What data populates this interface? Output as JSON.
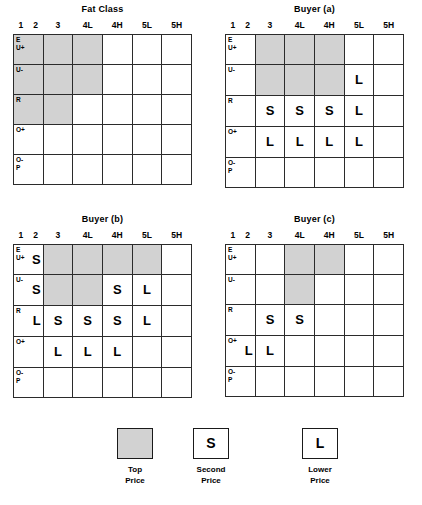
{
  "chart_data": {
    "type": "heatmap",
    "xlabel": "Fat Class",
    "ylabel": "Conformation Class",
    "columns": [
      "1",
      "2",
      "3",
      "4L",
      "4H",
      "5L",
      "5H"
    ],
    "column_groups": [
      "1-2",
      "3",
      "4L",
      "4H",
      "5L",
      "5H"
    ],
    "rows": [
      {
        "line1": "E",
        "line2": "U+"
      },
      {
        "line1": "U-",
        "line2": ""
      },
      {
        "line1": "R",
        "line2": ""
      },
      {
        "line1": "O+",
        "line2": ""
      },
      {
        "line1": "O-",
        "line2": "P"
      }
    ],
    "legend_position": "bottom",
    "grid": true,
    "panels": [
      {
        "name": "fat-class",
        "title": "Fat Class",
        "cells": [
          [
            "top",
            "top",
            "top",
            "",
            "",
            ""
          ],
          [
            "top",
            "top",
            "top",
            "",
            "",
            ""
          ],
          [
            "top",
            "top",
            "",
            "",
            "",
            ""
          ],
          [
            "",
            "",
            "",
            "",
            "",
            ""
          ],
          [
            "",
            "",
            "",
            "",
            "",
            ""
          ]
        ],
        "marks": [
          [
            "",
            "",
            "",
            "",
            "",
            ""
          ],
          [
            "",
            "",
            "",
            "",
            "",
            ""
          ],
          [
            "",
            "",
            "",
            "",
            "",
            ""
          ],
          [
            "",
            "",
            "",
            "",
            "",
            ""
          ],
          [
            "",
            "",
            "",
            "",
            "",
            ""
          ]
        ]
      },
      {
        "name": "buyer-a",
        "title": "Buyer (a)",
        "cells": [
          [
            "",
            "top",
            "top",
            "top",
            "",
            ""
          ],
          [
            "",
            "top",
            "top",
            "top",
            "",
            ""
          ],
          [
            "",
            "",
            "",
            "",
            "",
            ""
          ],
          [
            "",
            "",
            "",
            "",
            "",
            ""
          ],
          [
            "",
            "",
            "",
            "",
            "",
            ""
          ]
        ],
        "marks": [
          [
            "",
            "",
            "",
            "",
            "",
            ""
          ],
          [
            "",
            "",
            "",
            "",
            "L",
            ""
          ],
          [
            "",
            "S",
            "S",
            "S",
            "L",
            ""
          ],
          [
            "",
            "L",
            "L",
            "L",
            "L",
            ""
          ],
          [
            "",
            "",
            "",
            "",
            "",
            ""
          ]
        ]
      },
      {
        "name": "buyer-b",
        "title": "Buyer (b)",
        "cells": [
          [
            "",
            "top",
            "top",
            "top",
            "top",
            ""
          ],
          [
            "",
            "top",
            "top",
            "",
            "",
            ""
          ],
          [
            "",
            "",
            "",
            "",
            "",
            ""
          ],
          [
            "",
            "",
            "",
            "",
            "",
            ""
          ],
          [
            "",
            "",
            "",
            "",
            "",
            ""
          ]
        ],
        "marks": [
          [
            "S",
            "",
            "",
            "",
            "",
            ""
          ],
          [
            "S",
            "",
            "",
            "S",
            "L",
            ""
          ],
          [
            "L",
            "S",
            "S",
            "S",
            "L",
            ""
          ],
          [
            "",
            "L",
            "L",
            "L",
            "",
            ""
          ],
          [
            "",
            "",
            "",
            "",
            "",
            ""
          ]
        ]
      },
      {
        "name": "buyer-c",
        "title": "Buyer (c)",
        "cells": [
          [
            "",
            "",
            "top",
            "top",
            "",
            ""
          ],
          [
            "",
            "",
            "top",
            "",
            "",
            ""
          ],
          [
            "",
            "",
            "",
            "",
            "",
            ""
          ],
          [
            "",
            "",
            "",
            "",
            "",
            ""
          ],
          [
            "",
            "",
            "",
            "",
            "",
            ""
          ]
        ],
        "marks": [
          [
            "",
            "",
            "",
            "",
            "",
            ""
          ],
          [
            "",
            "",
            "",
            "",
            "",
            ""
          ],
          [
            "",
            "S",
            "S",
            "",
            "",
            ""
          ],
          [
            "L",
            "L",
            "",
            "",
            "",
            ""
          ],
          [
            "",
            "",
            "",
            "",
            "",
            ""
          ]
        ]
      }
    ],
    "legend": [
      {
        "symbol": "",
        "style": "shaded",
        "line1": "Top",
        "line2": "Price"
      },
      {
        "symbol": "S",
        "style": "outline",
        "line1": "Second",
        "line2": "Price"
      },
      {
        "symbol": "L",
        "style": "outline",
        "line1": "Lower",
        "line2": "Price"
      }
    ]
  },
  "colors": {
    "top_price_fill": "#d2d2d2",
    "grid_line": "#2b2b2b",
    "background": "#ffffff",
    "text": "#000000"
  }
}
